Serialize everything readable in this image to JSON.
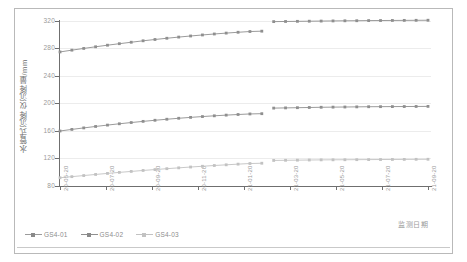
{
  "chart_data": {
    "type": "line",
    "title": "",
    "xlabel": "监测日期",
    "ylabel": "水管式沉降仪沉降量/mm",
    "ylim": [
      80,
      320
    ],
    "yticks": [
      80,
      120,
      160,
      200,
      240,
      280,
      320
    ],
    "grid": true,
    "legend_position": "bottom-left",
    "xticks": [
      "20-05-20",
      "20-07-20",
      "20-09-20",
      "20-11-20",
      "21-01-20",
      "21-03-20",
      "21-05-20",
      "21-07-20",
      "21-09-20"
    ],
    "x": [
      "20-05-20",
      "20-06-04",
      "20-06-19",
      "20-07-04",
      "20-07-19",
      "20-08-03",
      "20-08-18",
      "20-09-02",
      "20-09-17",
      "20-10-02",
      "20-10-17",
      "20-11-01",
      "20-11-16",
      "20-12-01",
      "20-12-16",
      "20-12-31",
      "21-01-15",
      "21-01-20",
      "21-03-05",
      "21-03-20",
      "21-04-04",
      "21-04-19",
      "21-05-04",
      "21-05-19",
      "21-06-03",
      "21-06-18",
      "21-07-03",
      "21-07-18",
      "21-08-02",
      "21-08-17",
      "21-09-01",
      "21-09-20"
    ],
    "series": [
      {
        "name": "GS4-01",
        "color": "#8f8f8f",
        "values": [
          275.0,
          277.6,
          280.1,
          282.5,
          284.8,
          287.0,
          289.1,
          291.2,
          293.1,
          294.9,
          296.6,
          298.2,
          299.7,
          301.1,
          302.4,
          303.6,
          304.7,
          305.2,
          319.1,
          319.3,
          319.5,
          319.7,
          319.9,
          320.1,
          320.3,
          320.4,
          320.6,
          320.7,
          320.8,
          320.9,
          321.0,
          321.1
        ]
      },
      {
        "name": "GS4-02",
        "color": "#8f8f8f",
        "values": [
          160.0,
          162.3,
          164.5,
          166.6,
          168.6,
          170.5,
          172.3,
          174.0,
          175.6,
          177.1,
          178.5,
          179.8,
          181.0,
          182.1,
          183.1,
          184.0,
          184.8,
          185.2,
          193.3,
          193.6,
          193.9,
          194.2,
          194.5,
          194.7,
          194.9,
          195.1,
          195.3,
          195.4,
          195.5,
          195.6,
          195.7,
          195.8
        ]
      },
      {
        "name": "GS4-03",
        "color": "#c2c2c2",
        "values": [
          92.0,
          93.6,
          95.2,
          96.8,
          98.3,
          99.8,
          101.2,
          102.6,
          103.9,
          105.2,
          106.4,
          107.6,
          108.7,
          109.8,
          110.8,
          111.8,
          112.7,
          113.1,
          117.2,
          117.4,
          117.6,
          117.8,
          118.0,
          118.1,
          118.2,
          118.3,
          118.4,
          118.5,
          118.6,
          118.7,
          118.8,
          118.9
        ]
      }
    ],
    "gap": {
      "after": "21-01-20",
      "before": "21-03-05"
    }
  },
  "axes": {
    "y_tick_labels": [
      "320",
      "280",
      "240",
      "200",
      "160",
      "120",
      "80"
    ],
    "x_tick_labels": [
      "20-05-20",
      "20-07-20",
      "20-09-20",
      "20-11-20",
      "21-01-20",
      "21-03-20",
      "21-05-20",
      "21-07-20",
      "21-09-20"
    ]
  },
  "legend": {
    "items": [
      {
        "label": "GS4-01"
      },
      {
        "label": "GS4-02"
      },
      {
        "label": "GS4-03"
      }
    ]
  }
}
